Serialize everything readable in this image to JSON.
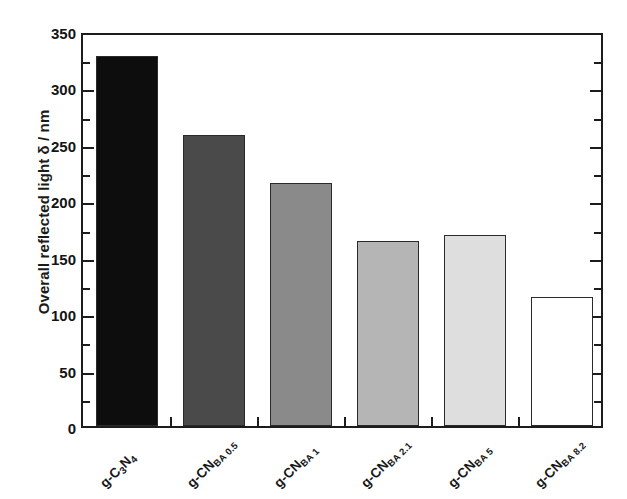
{
  "chart_data": {
    "type": "bar",
    "title": "",
    "subtitle": "",
    "xlabel": "",
    "ylabel": "Overall reflected light δ / nm",
    "categories": [
      "g-C3N4",
      "g-CN BA 0.5",
      "g-CN BA 1",
      "g-CN BA 2.1",
      "g-CN BA 5",
      "g-CN BA 8.2"
    ],
    "category_parts": [
      {
        "base": "g-C",
        "sub1": "3",
        "mid": "N",
        "sub2": "4"
      },
      {
        "base": "g-CN",
        "sub1": "BA 0.5"
      },
      {
        "base": "g-CN",
        "sub1": "BA 1"
      },
      {
        "base": "g-CN",
        "sub1": "BA 2.1"
      },
      {
        "base": "g-CN",
        "sub1": "BA 5"
      },
      {
        "base": "g-CN",
        "sub1": "BA 8.2"
      }
    ],
    "values": [
      328,
      258,
      215,
      164,
      169,
      114
    ],
    "bar_colors": [
      "#0d0d0d",
      "#4a4a4a",
      "#8a8a8a",
      "#b5b5b5",
      "#dedede",
      "#ffffff"
    ],
    "ylim": [
      0,
      350
    ],
    "yticks": [
      0,
      50,
      100,
      150,
      200,
      250,
      300,
      350
    ],
    "ytick_labels": [
      "0",
      "50",
      "100",
      "150",
      "200",
      "250",
      "300",
      "350"
    ],
    "yminor_step": 25,
    "grid": false,
    "legend": null,
    "axis_color": "#1c1c1c",
    "background": "#ffffff"
  }
}
